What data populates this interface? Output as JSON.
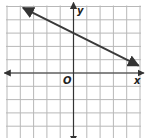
{
  "chart_data": {
    "type": "line",
    "title": "",
    "xlabel": "x",
    "ylabel": "y",
    "origin_label": "O",
    "xlim": [
      -5,
      5
    ],
    "ylim": [
      -5,
      5
    ],
    "grid": true,
    "grid_step": 1,
    "series": [
      {
        "name": "line",
        "equation": "y = -0.5x + 3",
        "slope": -0.5,
        "intercept": 3,
        "x": [
          -3.8,
          0,
          4.9
        ],
        "y": [
          4.9,
          3,
          0.55
        ],
        "arrows": "both"
      }
    ]
  },
  "colors": {
    "grid": "#b8b8b8",
    "axis": "#333333",
    "line": "#3a3a3a"
  }
}
